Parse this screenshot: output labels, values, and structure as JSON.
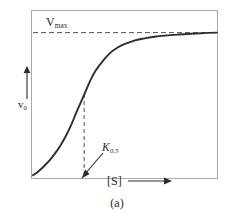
{
  "figure": {
    "caption": "(a)",
    "background_color": "#ffffff",
    "frame_color": "#a8a8a8",
    "curve_color": "#2e2e2e",
    "dash_color": "#555555"
  },
  "labels": {
    "vmax": "V",
    "vmax_sub": "max",
    "y_axis": "v",
    "y_axis_sub": "0",
    "x_axis": "[S]",
    "k_half": "K",
    "k_half_sub": "0.5"
  },
  "chart_data": {
    "type": "line",
    "title": "",
    "subtitle": "",
    "xlabel": "[S]",
    "ylabel": "v0",
    "caption": "(a)",
    "grid": false,
    "legend": null,
    "xlim": [
      0,
      1
    ],
    "ylim": [
      0,
      1
    ],
    "axis_ticks": {
      "x": [],
      "y": []
    },
    "annotations": [
      {
        "name": "vmax-asymptote",
        "text": "Vmax",
        "type": "horizontal-dashed-line",
        "y": 0.87,
        "x_start": 0.0,
        "x_end": 1.0
      },
      {
        "name": "k-half-dropline",
        "text": "K0.5",
        "type": "vertical-dashed-line",
        "x": 0.278,
        "y_start": 0.0,
        "y_end": 0.5
      },
      {
        "name": "k-half-pointer",
        "type": "arrow",
        "from_x": 0.42,
        "from_y": 0.19,
        "to_x": 0.279,
        "to_y": 0.02
      }
    ],
    "series": [
      {
        "name": "sigmoidal-velocity-curve",
        "shape": "sigmoid",
        "x": [
          0.0,
          0.03,
          0.06,
          0.09,
          0.12,
          0.15,
          0.18,
          0.21,
          0.24,
          0.28,
          0.31,
          0.34,
          0.38,
          0.42,
          0.46,
          0.5,
          0.55,
          0.6,
          0.66,
          0.72,
          0.79,
          0.86,
          0.93,
          1.0
        ],
        "y": [
          0.01,
          0.035,
          0.065,
          0.1,
          0.142,
          0.192,
          0.25,
          0.32,
          0.4,
          0.5,
          0.578,
          0.64,
          0.7,
          0.748,
          0.78,
          0.802,
          0.822,
          0.834,
          0.845,
          0.852,
          0.858,
          0.863,
          0.867,
          0.87
        ]
      }
    ]
  }
}
